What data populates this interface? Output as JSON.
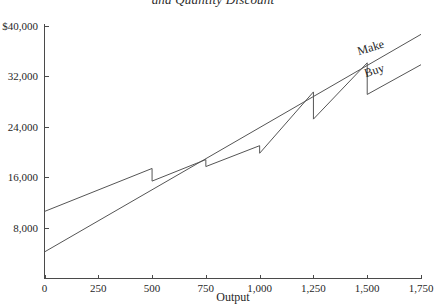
{
  "chart_data": {
    "type": "line",
    "title": "and Quantity Discount",
    "xlabel": "Output",
    "ylabel": "",
    "xlim": [
      0,
      1750
    ],
    "ylim": [
      0,
      40000
    ],
    "grid": false,
    "legend_position": "inline-right",
    "xticks": [
      0,
      250,
      500,
      750,
      1000,
      1250,
      1500,
      1750
    ],
    "xtick_labels": [
      "0",
      "250",
      "500",
      "750",
      "1,000",
      "1,250",
      "1,500",
      "1,750"
    ],
    "yticks": [
      8000,
      16000,
      24000,
      32000,
      40000
    ],
    "ytick_labels": [
      "8,000",
      "16,000",
      "24,000",
      "32,000",
      "$40,000"
    ],
    "series": [
      {
        "name": "Make",
        "label": "Make",
        "kind": "straight-line",
        "points": [
          {
            "x": 0,
            "y": 4200
          },
          {
            "x": 1750,
            "y": 38600
          }
        ]
      },
      {
        "name": "Buy",
        "label": "Buy",
        "kind": "stepped-discount",
        "points": [
          {
            "x": 0,
            "y": 10600
          },
          {
            "x": 500,
            "y": 17400
          },
          {
            "x": 500,
            "y": 15400
          },
          {
            "x": 750,
            "y": 18800
          },
          {
            "x": 750,
            "y": 17700
          },
          {
            "x": 1000,
            "y": 21000
          },
          {
            "x": 1000,
            "y": 19800
          },
          {
            "x": 1250,
            "y": 29500
          },
          {
            "x": 1250,
            "y": 25200
          },
          {
            "x": 1500,
            "y": 34100
          },
          {
            "x": 1500,
            "y": 29100
          },
          {
            "x": 1750,
            "y": 33800
          }
        ]
      }
    ]
  }
}
